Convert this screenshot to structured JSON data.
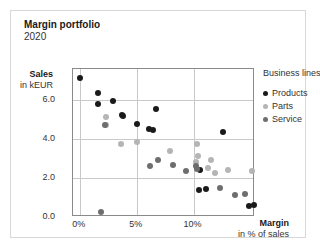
{
  "chart_data": {
    "type": "scatter",
    "title": "Margin portfolio",
    "subtitle": "2020",
    "xlabel": "Margin",
    "xlabel_sub": "in % of sales",
    "ylabel": "Sales",
    "ylabel_sub": "in kEUR",
    "xlim": [
      -0.6,
      15.4
    ],
    "ylim": [
      0,
      7.6
    ],
    "xticks": [
      "0%",
      "5%",
      "10%"
    ],
    "xtick_values": [
      0,
      5,
      10
    ],
    "yticks": [
      "0.0",
      "2.0",
      "4.0",
      "6.0"
    ],
    "ytick_values": [
      0,
      2,
      4,
      6
    ],
    "grid": true,
    "legend_title": "Business lines",
    "legend_position": "right",
    "colors": {
      "products": "#1a1a1a",
      "parts": "#b5b5b5",
      "service": "#6e6e6e",
      "grid": "#c9c9c9",
      "frame": "#8a8a8a",
      "card_border": "#d8d8d8",
      "background": "#ffffff"
    },
    "series": [
      {
        "name": "Products",
        "color": "#1a1a1a",
        "points": [
          {
            "x": 0.0,
            "y": 7.15
          },
          {
            "x": 1.6,
            "y": 6.35
          },
          {
            "x": 1.6,
            "y": 5.8
          },
          {
            "x": 2.9,
            "y": 5.95
          },
          {
            "x": 3.7,
            "y": 5.25
          },
          {
            "x": 3.8,
            "y": 5.2
          },
          {
            "x": 5.0,
            "y": 4.8
          },
          {
            "x": 6.1,
            "y": 4.5
          },
          {
            "x": 6.4,
            "y": 4.48
          },
          {
            "x": 6.7,
            "y": 5.55
          },
          {
            "x": 12.6,
            "y": 4.35
          },
          {
            "x": 10.6,
            "y": 2.4
          },
          {
            "x": 10.5,
            "y": 1.4
          },
          {
            "x": 11.1,
            "y": 1.45
          },
          {
            "x": 14.9,
            "y": 0.55
          },
          {
            "x": 15.3,
            "y": 0.6
          }
        ]
      },
      {
        "name": "Parts",
        "color": "#b5b5b5",
        "points": [
          {
            "x": 2.3,
            "y": 5.15
          },
          {
            "x": 2.3,
            "y": 4.7
          },
          {
            "x": 3.6,
            "y": 3.75
          },
          {
            "x": 5.0,
            "y": 3.85
          },
          {
            "x": 7.9,
            "y": 3.4
          },
          {
            "x": 10.3,
            "y": 3.75
          },
          {
            "x": 10.35,
            "y": 3.15
          },
          {
            "x": 10.2,
            "y": 2.85
          },
          {
            "x": 11.5,
            "y": 2.95
          },
          {
            "x": 11.3,
            "y": 2.5
          },
          {
            "x": 11.9,
            "y": 2.25
          },
          {
            "x": 13.0,
            "y": 2.4
          },
          {
            "x": 15.1,
            "y": 2.35
          }
        ]
      },
      {
        "name": "Service",
        "color": "#6e6e6e",
        "points": [
          {
            "x": 2.2,
            "y": 4.7
          },
          {
            "x": 1.9,
            "y": 0.25
          },
          {
            "x": 6.2,
            "y": 2.6
          },
          {
            "x": 6.9,
            "y": 2.95
          },
          {
            "x": 8.2,
            "y": 2.65
          },
          {
            "x": 9.3,
            "y": 2.35
          },
          {
            "x": 10.2,
            "y": 2.6
          },
          {
            "x": 10.3,
            "y": 2.45
          },
          {
            "x": 12.3,
            "y": 1.5
          },
          {
            "x": 13.6,
            "y": 1.15
          },
          {
            "x": 14.5,
            "y": 1.2
          }
        ]
      }
    ]
  }
}
